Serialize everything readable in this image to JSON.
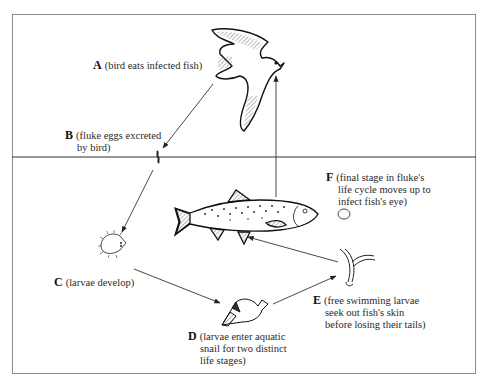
{
  "diagram": {
    "type": "life-cycle",
    "regions": [
      {
        "name": "air",
        "position": "above water line"
      },
      {
        "name": "water",
        "position": "below water line"
      }
    ],
    "stages": [
      {
        "id": "A",
        "letter": "A",
        "line1": "(bird eats infected fish)",
        "organism": "bird"
      },
      {
        "id": "B",
        "letter": "B",
        "line1": "(fluke eggs excreted",
        "line2": "by bird)",
        "organism": "fluke egg"
      },
      {
        "id": "C",
        "letter": "C",
        "line1": "(larvae develop)",
        "organism": "larva"
      },
      {
        "id": "D",
        "letter": "D",
        "line1": "(larvae enter aquatic",
        "line2": "snail for two distinct",
        "line3": "life stages)",
        "organism": "snail"
      },
      {
        "id": "E",
        "letter": "E",
        "line1": "(free swimming larvae",
        "line2": "seek out fish's skin",
        "line3": "before losing their tails)",
        "organism": "cercaria"
      },
      {
        "id": "F",
        "letter": "F",
        "line1": "(final stage in fluke's",
        "line2": "life cycle moves up to",
        "line3": "infect fish's eye)",
        "organism": "cyst"
      }
    ],
    "edges": [
      {
        "from": "A",
        "to": "B"
      },
      {
        "from": "B",
        "to": "C"
      },
      {
        "from": "C",
        "to": "D"
      },
      {
        "from": "D",
        "to": "E"
      },
      {
        "from": "E",
        "to": "fish"
      },
      {
        "from": "fish",
        "to": "A"
      }
    ],
    "colors": {
      "line": "#333333",
      "frame": "#8a8a8a",
      "background": "#ffffff"
    }
  }
}
